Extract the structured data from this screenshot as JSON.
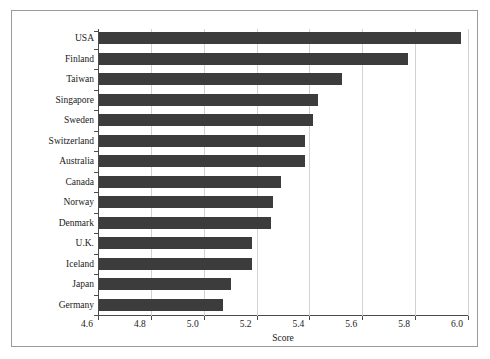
{
  "chart_data": {
    "type": "bar",
    "orientation": "horizontal",
    "title": "",
    "xlabel": "Score",
    "ylabel": "",
    "xlim": [
      4.6,
      6.0
    ],
    "xticks": [
      "4.6",
      "4.8",
      "5.0",
      "5.2",
      "5.4",
      "5.6",
      "5.8",
      "6.0"
    ],
    "xtick_values": [
      4.6,
      4.8,
      5.0,
      5.2,
      5.4,
      5.6,
      5.8,
      6.0
    ],
    "grid": "vertical",
    "legend": "none",
    "bar_color": "#3c3c3c",
    "categories": [
      "USA",
      "Finland",
      "Taiwan",
      "Singapore",
      "Sweden",
      "Switzerland",
      "Australia",
      "Canada",
      "Norway",
      "Denmark",
      "U.K.",
      "Iceland",
      "Japan",
      "Germany"
    ],
    "values": [
      5.97,
      5.77,
      5.52,
      5.43,
      5.41,
      5.38,
      5.38,
      5.29,
      5.26,
      5.25,
      5.18,
      5.18,
      5.1,
      5.07
    ]
  }
}
